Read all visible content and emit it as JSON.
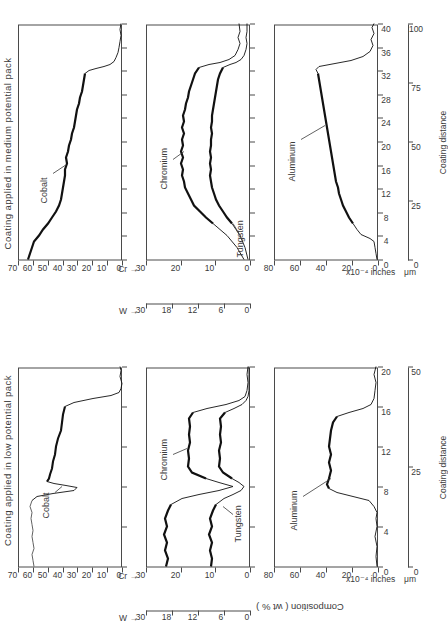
{
  "figure": {
    "axis_label_y": "Composition ( wt % )",
    "axis_label_x": "Coating distance",
    "unit_inches": "x10⁻⁴ inches",
    "unit_microns": "μm"
  },
  "groups": [
    {
      "id": "low",
      "title": "Coating applied in low potential pack",
      "x_inches_ticks": [
        "0",
        "4",
        "8",
        "12",
        "16",
        "20"
      ],
      "x_micron_ticks": [
        "0",
        "25",
        "50"
      ],
      "panels": [
        {
          "id": "cobalt-low",
          "series_label": "Cobalt",
          "y_ticks": [
            "70",
            "60",
            "50",
            "40",
            "30",
            "20",
            "10",
            "0"
          ]
        },
        {
          "id": "crw-low",
          "series_label": "Chromium",
          "series_label2": "Tungsten",
          "y_ticks_cr": [
            "30",
            "20",
            "10",
            "0"
          ],
          "y_ticks_w": [
            "30",
            "18",
            "12",
            "6",
            "0"
          ],
          "y_axis_name_cr": "Cr →",
          "y_axis_name_w": "W →"
        },
        {
          "id": "aluminum-low",
          "series_label": "Aluminum",
          "y_ticks": [
            "80",
            "60",
            "40",
            "20",
            "0"
          ]
        }
      ]
    },
    {
      "id": "medium",
      "title": "Coating applied in medium potential pack",
      "x_inches_ticks": [
        "0",
        "4",
        "8",
        "12",
        "16",
        "20",
        "24",
        "28",
        "32",
        "36",
        "40"
      ],
      "x_micron_ticks": [
        "0",
        "25",
        "50",
        "75",
        "100"
      ],
      "panels": [
        {
          "id": "cobalt-medium",
          "series_label": "Cobalt",
          "y_ticks": [
            "70",
            "60",
            "50",
            "40",
            "30",
            "20",
            "10",
            "0"
          ]
        },
        {
          "id": "crw-medium",
          "series_label": "Chromium",
          "series_label2": "Tungsten",
          "y_ticks_cr": [
            "30",
            "20",
            "10",
            "0"
          ],
          "y_ticks_w": [
            "30",
            "18",
            "12",
            "6",
            "0"
          ],
          "y_axis_name_cr": "Cr →",
          "y_axis_name_w": "W →"
        },
        {
          "id": "aluminum-medium",
          "series_label": "Aluminum",
          "y_ticks": [
            "80",
            "60",
            "40",
            "20",
            "0"
          ]
        }
      ]
    }
  ],
  "chart_data": {
    "type": "line",
    "xlabel": "Coating distance",
    "ylabel": "Composition ( wt % )",
    "x_units": [
      "x10⁻⁴ inches",
      "μm"
    ],
    "grid": false,
    "legend": "inline annotations with leader lines",
    "panels": [
      {
        "panel": "cobalt-low",
        "group": "Coating applied in low potential pack",
        "series_name": "Cobalt",
        "xlim": [
          0,
          20
        ],
        "ylim": [
          0,
          70
        ],
        "yticks": [
          0,
          10,
          20,
          30,
          40,
          50,
          60,
          70
        ],
        "xticks_inches": [
          0,
          4,
          8,
          12,
          16,
          20
        ],
        "xticks_microns": [
          0,
          25,
          50
        ],
        "x": [
          0.0,
          0.6,
          1.2,
          1.8,
          2.4,
          3.0,
          3.6,
          4.2,
          4.8,
          5.4,
          6.0,
          6.6,
          7.0,
          7.3,
          7.6,
          7.9,
          8.1,
          8.3,
          8.5,
          8.8,
          9.2,
          9.8,
          10.5,
          11.2,
          12.0,
          12.8,
          13.6,
          14.4,
          15.2,
          16.0,
          16.4,
          16.8,
          17.1,
          17.4,
          17.8,
          18.3,
          19.0,
          19.6,
          20.0
        ],
        "y": [
          60.0,
          60.5,
          60.8,
          60.2,
          60.6,
          61.0,
          60.4,
          60.8,
          61.2,
          61.0,
          61.5,
          61.0,
          58.0,
          47.0,
          33.0,
          31.5,
          38.0,
          46.0,
          51.0,
          50.0,
          49.0,
          48.0,
          47.5,
          46.0,
          45.0,
          43.5,
          42.0,
          41.0,
          40.5,
          39.0,
          33.0,
          20.0,
          8.0,
          2.5,
          1.5,
          1.2,
          2.2,
          1.4,
          1.8
        ]
      },
      {
        "panel": "crw-low",
        "group": "Coating applied in low potential pack",
        "series": [
          {
            "name": "Chromium",
            "axis": "Cr",
            "ylim": [
              0,
              30
            ],
            "yticks": [
              0,
              10,
              20,
              30
            ],
            "x": [
              0.0,
              0.8,
              1.6,
              2.4,
              3.2,
              4.0,
              4.8,
              5.6,
              6.2,
              6.8,
              7.2,
              7.6,
              8.0,
              8.4,
              8.8,
              9.4,
              10.0,
              10.8,
              11.6,
              12.4,
              13.2,
              14.0,
              14.8,
              15.4,
              15.8,
              16.2,
              16.6,
              17.0,
              17.6,
              18.4,
              19.2,
              20.0
            ],
            "y": [
              24.5,
              24.0,
              24.6,
              24.2,
              24.8,
              24.3,
              24.6,
              24.0,
              23.0,
              20.0,
              15.0,
              9.0,
              5.5,
              8.0,
              13.0,
              17.0,
              18.0,
              17.5,
              18.0,
              17.0,
              17.5,
              17.0,
              17.5,
              16.0,
              12.0,
              6.0,
              2.5,
              1.5,
              1.2,
              1.0,
              1.1,
              1.0
            ]
          },
          {
            "name": "Tungsten",
            "axis": "W",
            "ylim": [
              0,
              30
            ],
            "yticks": [
              0,
              6,
              12,
              18,
              30
            ],
            "x": [
              0.0,
              0.8,
              1.6,
              2.4,
              3.2,
              4.0,
              4.8,
              5.6,
              6.2,
              6.8,
              7.2,
              7.6,
              8.0,
              8.4,
              8.8,
              9.4,
              10.0,
              10.8,
              11.6,
              12.4,
              13.2,
              14.0,
              14.8,
              15.4,
              15.8,
              16.2,
              16.6,
              17.0,
              17.6,
              18.4,
              19.2,
              20.0
            ],
            "y": [
              11.5,
              11.2,
              11.6,
              11.3,
              11.7,
              11.4,
              11.6,
              11.2,
              10.8,
              9.5,
              7.0,
              4.0,
              2.0,
              3.5,
              6.5,
              9.0,
              9.5,
              9.2,
              9.6,
              9.0,
              9.4,
              9.0,
              9.3,
              8.0,
              5.5,
              2.5,
              1.2,
              0.8,
              0.6,
              0.5,
              0.6,
              0.5
            ]
          }
        ]
      },
      {
        "panel": "aluminum-low",
        "group": "Coating applied in low potential pack",
        "series_name": "Aluminum",
        "xlim": [
          0,
          20
        ],
        "ylim": [
          0,
          80
        ],
        "yticks": [
          0,
          20,
          40,
          60,
          80
        ],
        "x": [
          0.0,
          1.0,
          2.0,
          3.0,
          4.0,
          4.8,
          5.4,
          6.0,
          6.6,
          7.0,
          7.4,
          7.8,
          8.2,
          8.8,
          9.6,
          10.4,
          11.2,
          12.0,
          12.8,
          13.6,
          14.4,
          15.0,
          15.4,
          15.8,
          16.2,
          16.8,
          17.6,
          18.4,
          19.2,
          20.0
        ],
        "y": [
          1.0,
          1.2,
          1.0,
          1.5,
          1.2,
          1.4,
          1.2,
          2.0,
          8.0,
          20.0,
          32.0,
          36.0,
          37.0,
          36.0,
          35.0,
          36.0,
          35.0,
          36.0,
          35.5,
          35.0,
          34.0,
          30.0,
          20.0,
          9.0,
          4.0,
          2.5,
          3.0,
          2.0,
          3.5,
          2.5
        ]
      },
      {
        "panel": "cobalt-medium",
        "group": "Coating applied in medium potential pack",
        "series_name": "Cobalt",
        "xlim": [
          0,
          40
        ],
        "ylim": [
          0,
          70
        ],
        "yticks": [
          0,
          10,
          20,
          30,
          40,
          50,
          60,
          70
        ],
        "xticks_inches": [
          0,
          4,
          8,
          12,
          16,
          20,
          24,
          28,
          32,
          36,
          40
        ],
        "xticks_microns": [
          0,
          25,
          50,
          75,
          100
        ],
        "x": [
          0.0,
          1.5,
          3.0,
          4.0,
          5.0,
          6.0,
          7.0,
          8.0,
          9.0,
          10.0,
          11.0,
          12.0,
          13.0,
          14.0,
          15.0,
          16.0,
          17.0,
          18.0,
          19.0,
          20.0,
          21.0,
          22.0,
          23.0,
          24.0,
          25.0,
          26.0,
          27.0,
          28.0,
          29.0,
          30.0,
          31.0,
          31.8,
          32.4,
          33.0,
          33.6,
          34.4,
          35.2,
          36.0,
          37.0,
          38.0,
          39.0,
          40.0
        ],
        "y": [
          64.0,
          62.0,
          60.0,
          57.0,
          54.0,
          51.0,
          48.0,
          45.0,
          43.0,
          42.0,
          41.0,
          40.5,
          40.0,
          39.5,
          39.0,
          38.0,
          38.5,
          37.5,
          37.0,
          36.0,
          35.0,
          34.0,
          33.5,
          33.0,
          32.0,
          31.0,
          30.0,
          29.0,
          28.5,
          28.0,
          27.0,
          24.0,
          18.0,
          10.0,
          6.0,
          4.0,
          3.0,
          2.0,
          1.5,
          1.2,
          1.0,
          1.0
        ]
      },
      {
        "panel": "crw-medium",
        "group": "Coating applied in medium potential pack",
        "series": [
          {
            "name": "Chromium",
            "axis": "Cr",
            "ylim": [
              0,
              30
            ],
            "yticks": [
              0,
              10,
              20,
              30
            ],
            "x": [
              0.0,
              2.0,
              4.0,
              5.0,
              6.0,
              7.0,
              8.0,
              9.0,
              10.0,
              11.0,
              12.0,
              13.0,
              14.0,
              15.0,
              16.0,
              17.0,
              18.0,
              19.0,
              20.0,
              21.0,
              22.0,
              23.0,
              24.0,
              25.0,
              26.0,
              27.0,
              28.0,
              29.0,
              30.0,
              31.0,
              32.0,
              32.8,
              33.4,
              34.0,
              35.0,
              36.0,
              37.0,
              38.0,
              39.0,
              40.0
            ],
            "y": [
              2.0,
              4.0,
              7.0,
              9.0,
              11.0,
              13.0,
              15.0,
              16.5,
              17.5,
              18.5,
              19.0,
              19.5,
              19.0,
              19.5,
              19.0,
              18.5,
              19.0,
              18.5,
              18.0,
              18.5,
              18.0,
              17.5,
              18.0,
              17.5,
              17.0,
              16.5,
              16.0,
              15.5,
              15.0,
              14.0,
              12.0,
              9.0,
              6.0,
              4.0,
              3.0,
              2.5,
              2.0,
              2.5,
              2.0,
              2.2
            ]
          },
          {
            "name": "Tungsten",
            "axis": "W",
            "ylim": [
              0,
              30
            ],
            "yticks": [
              0,
              6,
              12,
              18,
              30
            ],
            "x": [
              0.0,
              2.0,
              4.0,
              5.0,
              6.0,
              7.0,
              8.0,
              9.0,
              10.0,
              11.0,
              12.0,
              13.0,
              14.0,
              15.0,
              16.0,
              17.0,
              18.0,
              19.0,
              20.0,
              21.0,
              22.0,
              23.0,
              24.0,
              25.0,
              26.0,
              27.0,
              28.0,
              29.0,
              30.0,
              31.0,
              32.0,
              32.8,
              33.4,
              34.0,
              35.0,
              36.0,
              37.0,
              38.0,
              39.0,
              40.0
            ],
            "y": [
              0.8,
              1.5,
              3.0,
              4.0,
              5.0,
              6.0,
              7.0,
              7.8,
              8.4,
              9.0,
              9.4,
              9.6,
              9.3,
              9.6,
              9.4,
              9.0,
              9.4,
              9.0,
              8.8,
              9.0,
              8.8,
              8.5,
              8.8,
              8.5,
              8.2,
              8.0,
              7.8,
              7.5,
              7.2,
              6.6,
              5.6,
              4.2,
              2.8,
              1.8,
              1.3,
              1.0,
              0.9,
              1.0,
              0.9,
              1.0
            ]
          }
        ]
      },
      {
        "panel": "aluminum-medium",
        "group": "Coating applied in medium potential pack",
        "series_name": "Aluminum",
        "xlim": [
          0,
          40
        ],
        "ylim": [
          0,
          80
        ],
        "yticks": [
          0,
          20,
          40,
          60,
          80
        ],
        "x": [
          0.0,
          1.0,
          2.0,
          3.0,
          3.6,
          4.2,
          5.0,
          6.0,
          7.0,
          8.0,
          9.0,
          10.0,
          11.0,
          12.0,
          13.0,
          14.0,
          15.0,
          16.0,
          17.0,
          18.0,
          19.0,
          20.0,
          21.0,
          22.0,
          23.0,
          24.0,
          25.0,
          26.0,
          27.0,
          28.0,
          29.0,
          30.0,
          31.0,
          31.8,
          32.4,
          33.0,
          33.8,
          34.6,
          35.4,
          36.2,
          37.0,
          38.0,
          39.0,
          40.0
        ],
        "y": [
          1.0,
          1.2,
          1.5,
          2.0,
          4.0,
          7.0,
          9.0,
          11.0,
          13.0,
          15.0,
          16.5,
          18.0,
          19.0,
          20.0,
          21.0,
          22.0,
          23.0,
          24.0,
          24.5,
          25.0,
          26.0,
          26.5,
          27.0,
          27.5,
          28.0,
          28.5,
          29.0,
          29.5,
          30.0,
          30.5,
          31.0,
          31.5,
          32.0,
          33.0,
          31.0,
          22.0,
          12.0,
          6.0,
          3.0,
          2.0,
          2.5,
          2.0,
          3.0,
          2.5
        ]
      }
    ]
  }
}
